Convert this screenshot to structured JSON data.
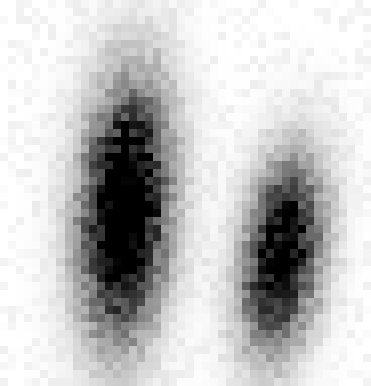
{
  "chart_data": {
    "type": "heatmap",
    "title": "",
    "xlabel": "",
    "ylabel": "",
    "colormap": "grayscale (white = low density, black = high density)",
    "grid": {
      "columns": 46,
      "rows": 48,
      "cell_px": 8
    },
    "background_color": "#ffffff",
    "peak_color": "#000000",
    "clusters": [
      {
        "name": "left-cluster",
        "center_px": [
          125,
          210
        ],
        "sigma_px": [
          30,
          85
        ],
        "peak_intensity": 1.0,
        "tilt_deg": -4
      },
      {
        "name": "right-cluster",
        "center_px": [
          282,
          255
        ],
        "sigma_px": [
          26,
          65
        ],
        "peak_intensity": 0.85,
        "tilt_deg": -8
      }
    ],
    "background_noise": 0.06,
    "legend": null,
    "axes_visible": false
  }
}
